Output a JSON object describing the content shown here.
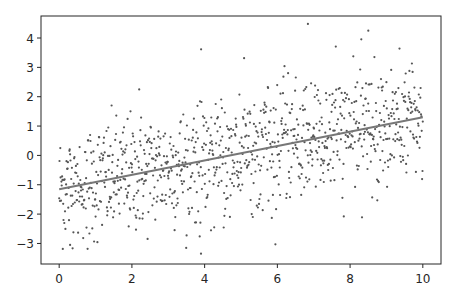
{
  "chart_data": {
    "type": "scatter",
    "title": "",
    "xlabel": "",
    "ylabel": "",
    "xlim": [
      -0.5,
      10.5
    ],
    "ylim": [
      -3.7,
      4.75
    ],
    "grid": false,
    "legend": null,
    "x_ticks": [
      0,
      2,
      4,
      6,
      8,
      10
    ],
    "y_ticks": [
      -3,
      -2,
      -1,
      0,
      1,
      2,
      3,
      4
    ],
    "series": [
      {
        "name": "points",
        "kind": "scatter",
        "color": "#555555",
        "n_points": 1000,
        "description": "noisy points around linear trend y ≈ 0.24x - 1.15 with noise sd ≈ 1",
        "notable_points": [
          {
            "x": 6.84,
            "y": 4.48
          },
          {
            "x": 8.5,
            "y": 4.25
          },
          {
            "x": 2.2,
            "y": 2.25
          },
          {
            "x": 0.3,
            "y": -3.05
          },
          {
            "x": 3.9,
            "y": -3.35
          }
        ]
      },
      {
        "name": "fit",
        "kind": "line",
        "color": "#777777",
        "x": [
          0,
          10
        ],
        "y": [
          -1.15,
          1.3
        ]
      }
    ]
  },
  "axes": {
    "x_tick_labels": [
      "0",
      "2",
      "4",
      "6",
      "8",
      "10"
    ],
    "y_tick_labels": [
      "−3",
      "−2",
      "−1",
      "0",
      "1",
      "2",
      "3",
      "4"
    ]
  }
}
